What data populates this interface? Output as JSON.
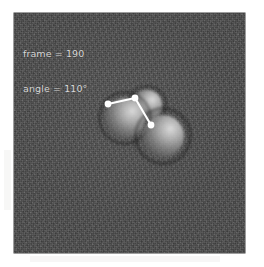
{
  "figure": {
    "kind": "micrograph-frame",
    "panel": {
      "background_color": "#4b4b4b",
      "width_px": 231,
      "height_px": 240,
      "left_px": 14,
      "top_px": 13
    },
    "overlay_text": {
      "color": "#d8d8d8",
      "lines": [
        "frame = 190",
        "angle = 110°"
      ],
      "line_frame": "frame = 190",
      "line_angle": "angle = 110°",
      "frame_label": "frame",
      "frame_value": "190",
      "angle_label": "angle",
      "angle_value": "110°"
    },
    "annotation": {
      "color": "#ffffff",
      "vertex_label": "vertex",
      "arm_a_label": "arm-a",
      "arm_b_label": "arm-b",
      "angle_degrees": 110,
      "points": {
        "arm_a_end": {
          "x": 94,
          "y": 91
        },
        "vertex": {
          "x": 121,
          "y": 85
        },
        "arm_b_end": {
          "x": 137,
          "y": 112
        }
      },
      "marker_radius_px": 3.4,
      "line_width_px": 2.1
    },
    "beads": [
      {
        "name": "bead-left",
        "cx": 111,
        "cy": 105,
        "r": 27
      },
      {
        "name": "bead-top",
        "cx": 133,
        "cy": 92,
        "r": 20
      },
      {
        "name": "bead-right",
        "cx": 149,
        "cy": 123,
        "r": 29
      }
    ]
  }
}
